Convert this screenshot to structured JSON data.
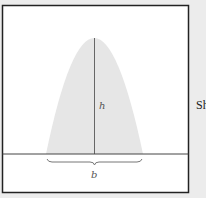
{
  "diagram": {
    "labels": {
      "height": "h",
      "base": "b"
    },
    "side_text": "Sh",
    "colors": {
      "region_fill": "#e6e6e6",
      "line": "#555555",
      "frame": "#222222",
      "background": "#ececec",
      "panel": "#ffffff"
    }
  }
}
